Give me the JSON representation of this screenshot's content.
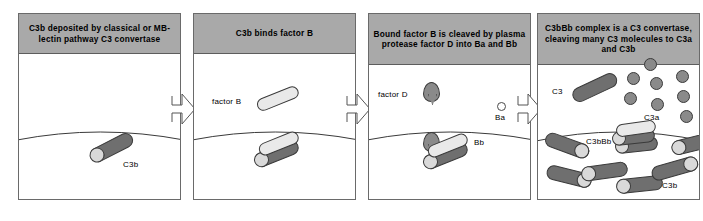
{
  "figure": {
    "colors": {
      "header_bg": "#a9a9a9",
      "rod_dark": "#6f6f6f",
      "rod_light": "#e9e9e9",
      "cap": "#d9d9d9",
      "circle_fill": "#8a8a8a",
      "panel_border": "#6a6a6a",
      "background": "#ffffff"
    }
  },
  "panels": [
    {
      "id": "panel-1",
      "header": "C3b deposited by classical or MB-lectin pathway C3 convertase",
      "labels": {
        "c3b": "C3b"
      },
      "molecules": [
        {
          "name": "c3b-rod",
          "type": "rod-dark-capped"
        }
      ]
    },
    {
      "id": "panel-2",
      "header": "C3b binds factor B",
      "labels": {
        "factor_b": "factor B"
      },
      "molecules": [
        {
          "name": "factor-b-rod",
          "type": "rod-light"
        },
        {
          "name": "c3b-rod",
          "type": "rod-dark-capped"
        },
        {
          "name": "factor-b-bound-rod",
          "type": "rod-light"
        }
      ]
    },
    {
      "id": "panel-3",
      "header": "Bound factor B is cleaved by plasma protease factor D into Ba and Bb",
      "labels": {
        "factor_d": "factor D",
        "ba": "Ba",
        "bb": "Bb"
      },
      "molecules": [
        {
          "name": "factor-d-teardrop",
          "type": "teardrop"
        },
        {
          "name": "ba-circle",
          "type": "circle-open"
        },
        {
          "name": "c3b-rod",
          "type": "rod-dark-capped"
        },
        {
          "name": "bb-rod",
          "type": "rod-light"
        }
      ]
    },
    {
      "id": "panel-4",
      "header": "C3bBb complex is a C3 convertase, cleaving many C3 molecules to C3a and C3b",
      "labels": {
        "c3": "C3",
        "c3a": "C3a",
        "c3bbb": "C3bBb",
        "c3b": "C3b"
      },
      "c3a_circle_count": 8,
      "c3b_rod_count": 7,
      "molecules": [
        {
          "name": "c3-rod",
          "type": "rod-dark"
        },
        {
          "name": "c3a-circles",
          "type": "circle-filled-cluster"
        },
        {
          "name": "c3bbb-complex",
          "type": "complex"
        },
        {
          "name": "c3b-rods",
          "type": "rod-dark-capped-cluster"
        }
      ]
    }
  ],
  "arrows": [
    {
      "name": "arrow-1-to-2",
      "direction": "right"
    },
    {
      "name": "arrow-2-to-3",
      "direction": "right"
    },
    {
      "name": "arrow-3-to-4",
      "direction": "right"
    }
  ]
}
